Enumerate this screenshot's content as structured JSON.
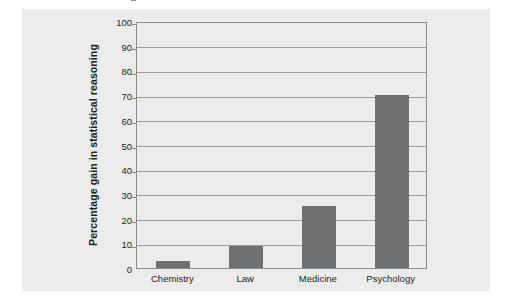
{
  "chart_data": {
    "type": "bar",
    "title": "",
    "subtitle": "",
    "categories": [
      "Chemistry",
      "Law",
      "Medicine",
      "Psychology"
    ],
    "values": [
      3,
      9,
      25,
      70
    ],
    "series": [
      {
        "name": "Percentage gain in statistical reasoning",
        "values": [
          3,
          9,
          25,
          70
        ]
      }
    ],
    "xlabel": "",
    "ylabel": "Percentage gain in statistical reasoning",
    "ylim": [
      0,
      100
    ],
    "ytick_step": 10,
    "yticks": [
      0,
      10,
      20,
      30,
      40,
      50,
      60,
      70,
      80,
      90,
      100
    ],
    "ytick_labels": [
      "0",
      "10",
      "20",
      "30",
      "40",
      "50",
      "60",
      "70",
      "80",
      "90",
      "100"
    ],
    "grid": true,
    "grid_axis": "y",
    "legend": false,
    "legend_position": "none",
    "bar_color": "#6e7072",
    "gridline_color": "#9a9c9e",
    "frame_color": "#8a8c8e",
    "canvas_color": "#ececed",
    "text_color": "#231f20",
    "annotations": []
  }
}
